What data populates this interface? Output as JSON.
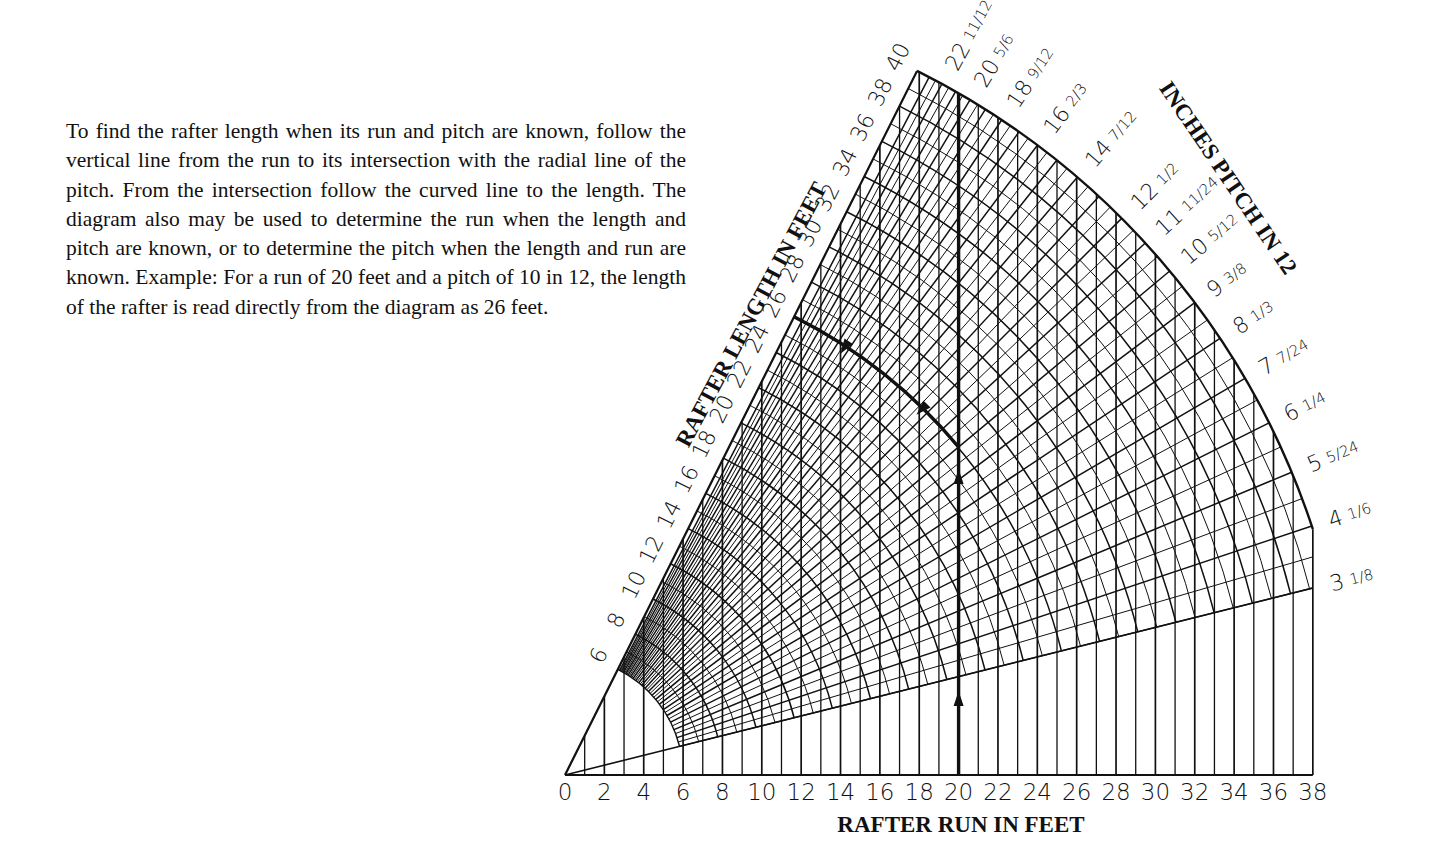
{
  "description": "To find the rafter length when its run and pitch are known, follow the vertical line from the run to its intersection with the radial line of the pitch. From the intersection follow the curved line to the length. The diagram also may be used to determine the run when the length and pitch are known, or to determine the pitch when the length and run are known. Example: For a run of 20 feet and a pitch of 10 in 12, the length of the rafter is read directly from the diagram as 26 feet.",
  "colors": {
    "ink": "#111111",
    "background": "#ffffff"
  },
  "chart_data": {
    "type": "nomogram",
    "x_axis": {
      "label": "RAFTER RUN IN FEET",
      "ticks": [
        0,
        2,
        4,
        6,
        8,
        10,
        12,
        14,
        16,
        18,
        20,
        22,
        24,
        26,
        28,
        30,
        32,
        34,
        36,
        38
      ],
      "range": [
        0,
        38
      ],
      "minor_step": 1
    },
    "length_axis": {
      "label": "RAFTER LENGTH IN FEET",
      "ticks": [
        6,
        8,
        10,
        12,
        14,
        16,
        18,
        20,
        22,
        24,
        26,
        28,
        30,
        32,
        34,
        36,
        38,
        40
      ],
      "range": [
        0,
        40
      ]
    },
    "pitch_axis": {
      "label": "INCHES PITCH IN 12",
      "pitches": [
        {
          "inches": "3",
          "fraction": "1/8"
        },
        {
          "inches": "4",
          "fraction": "1/6"
        },
        {
          "inches": "5",
          "fraction": "5/24"
        },
        {
          "inches": "6",
          "fraction": "1/4"
        },
        {
          "inches": "7",
          "fraction": "7/24"
        },
        {
          "inches": "8",
          "fraction": "1/3"
        },
        {
          "inches": "9",
          "fraction": "3/8"
        },
        {
          "inches": "10",
          "fraction": "5/12"
        },
        {
          "inches": "11",
          "fraction": "11/24"
        },
        {
          "inches": "12",
          "fraction": "1/2"
        },
        {
          "inches": "14",
          "fraction": "7/12"
        },
        {
          "inches": "16",
          "fraction": "2/3"
        },
        {
          "inches": "18",
          "fraction": "9/12"
        },
        {
          "inches": "20",
          "fraction": "5/6"
        },
        {
          "inches": "22",
          "fraction": "11/12"
        }
      ],
      "max_pitch_inches": 24
    },
    "example": {
      "run_ft": 20,
      "pitch_in_12": 10,
      "length_ft": 26
    }
  }
}
